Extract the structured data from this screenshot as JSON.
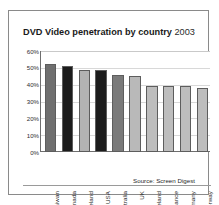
{
  "chart_data": {
    "type": "bar",
    "title": "DVD Video penetration by country 2003",
    "title_main": "DVD Video penetration by country",
    "title_year": "2003",
    "xlabel": "",
    "ylabel": "",
    "ylim": [
      0,
      60
    ],
    "grid": true,
    "legend": "none",
    "source": "Source: Screen Digest",
    "categories": [
      "Taiwan",
      "Canada",
      "Iceland",
      "USA",
      "Australia",
      "UK",
      "Ireland",
      "France",
      "Germany",
      "Norway"
    ],
    "values": [
      52,
      51,
      49,
      48.5,
      46,
      45,
      39.5,
      39.5,
      39,
      38
    ],
    "value_labels": [
      "52%",
      "51%",
      "49%",
      "49%",
      "46%",
      "45%",
      "40%",
      "40%",
      "39%",
      "38%"
    ],
    "bar_colors": [
      "#6f6f6f",
      "#1c1c1c",
      "#b3b3b3",
      "#1c1c1c",
      "#7a7a7a",
      "#b9b9b9",
      "#bdbdbd",
      "#bdbdbd",
      "#bdbdbd",
      "#bdbdbd"
    ],
    "ytick_labels": [
      "60%",
      "50%",
      "40%",
      "30%",
      "20%",
      "10%",
      "0%"
    ],
    "ytick_values": [
      60,
      50,
      40,
      30,
      20,
      10,
      0
    ],
    "axis_color": "#6e6e6e",
    "grid_color": "#d8d8d8",
    "background": "#ffffff",
    "frame_color": "#8a8a8a"
  }
}
